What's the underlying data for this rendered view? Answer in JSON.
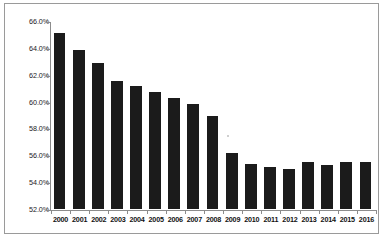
{
  "chart_data": {
    "type": "bar",
    "title": "",
    "subtitle": "",
    "xlabel": "",
    "ylabel": "",
    "categories": [
      "2000",
      "2001",
      "2002",
      "2003",
      "2004",
      "2005",
      "2006",
      "2007",
      "2008",
      "2009",
      "2010",
      "2011",
      "2012",
      "2013",
      "2014",
      "2015",
      "2016"
    ],
    "values": [
      65.1,
      63.85,
      62.85,
      61.55,
      61.15,
      60.75,
      60.3,
      59.85,
      58.95,
      56.15,
      55.35,
      55.15,
      54.95,
      55.5,
      55.3,
      55.5,
      55.5
    ],
    "series": [
      {
        "name": "",
        "values": [
          65.1,
          63.85,
          62.85,
          61.55,
          61.15,
          60.75,
          60.3,
          59.85,
          58.95,
          56.15,
          55.35,
          55.15,
          54.95,
          55.5,
          55.3,
          55.5,
          55.5
        ]
      }
    ],
    "ylim": [
      52.0,
      66.0
    ],
    "ytick_values": [
      52.0,
      54.0,
      56.0,
      58.0,
      60.0,
      62.0,
      64.0,
      66.0
    ],
    "ytick_labels": [
      "52.0%",
      "54.0%",
      "56.0%",
      "58.0%",
      "60.0%",
      "62.0%",
      "64.0%",
      "66.0%"
    ],
    "grid": false,
    "legend": null,
    "legend_position": "none",
    "bar_color": "#1b1b1b",
    "axis_color": "#8c8c8c",
    "background_color": "#ffffff",
    "border_color": "#9a9a9a",
    "annotations": []
  }
}
